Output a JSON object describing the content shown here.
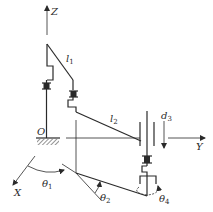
{
  "diagram": {
    "type": "robot-kinematic-schematic",
    "axes": {
      "z": {
        "label": "Z"
      },
      "y": {
        "label": "Y"
      },
      "x": {
        "label": "X"
      },
      "origin": {
        "label": "O"
      }
    },
    "links": [
      {
        "id": "l1",
        "label": "l",
        "subscript": "1"
      },
      {
        "id": "l2",
        "label": "l",
        "subscript": "2"
      }
    ],
    "joints": [
      {
        "id": "theta1",
        "label": "θ",
        "subscript": "1",
        "kind": "revolute"
      },
      {
        "id": "theta2",
        "label": "θ",
        "subscript": "2",
        "kind": "revolute"
      },
      {
        "id": "d3",
        "label": "d",
        "subscript": "3",
        "kind": "prismatic"
      },
      {
        "id": "theta4",
        "label": "θ",
        "subscript": "4",
        "kind": "revolute"
      }
    ],
    "colors": {
      "stroke": "#2a2a2a",
      "background": "#ffffff"
    }
  }
}
